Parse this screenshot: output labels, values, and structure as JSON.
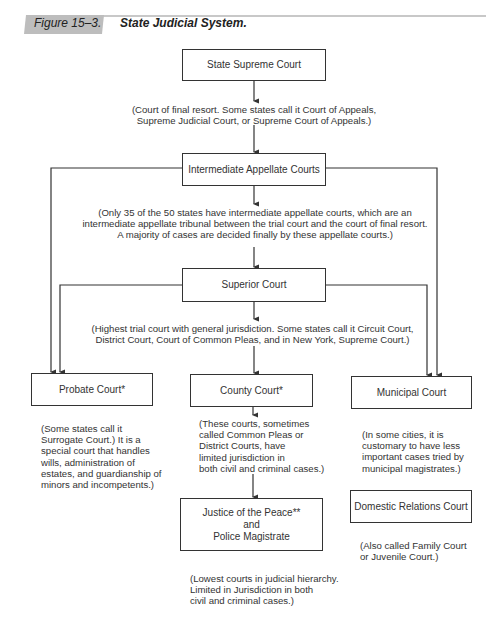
{
  "figure": {
    "label": "Figure 15–3.",
    "title": "State Judicial System."
  },
  "nodes": {
    "state_supreme": {
      "label": "State Supreme Court",
      "note": [
        "(Court of final resort. Some states call it Court of Appeals,",
        "Supreme Judicial Court, or Supreme Court of Appeals.)"
      ]
    },
    "intermediate": {
      "label": "Intermediate Appellate Courts",
      "note": [
        "(Only 35 of the 50 states have intermediate appellate courts, which are an",
        "intermediate appellate tribunal between the trial court and the court of final resort.",
        "A majority of cases are decided finally by these appellate courts.)"
      ]
    },
    "superior": {
      "label": "Superior Court",
      "note": [
        "(Highest trial court with general jurisdiction. Some states call it Circuit Court,",
        "District Court, Court of Common Pleas, and in New York, Supreme Court.)"
      ]
    },
    "probate": {
      "label": "Probate Court*",
      "note": [
        "(Some states call it",
        "Surrogate Court.) It is a",
        "special court that handles",
        "wills, administration of",
        "estates, and guardianship of",
        "minors and incompetents.)"
      ]
    },
    "county": {
      "label": "County Court*",
      "note": [
        "(These courts, sometimes",
        "called Common Pleas or",
        "District Courts, have",
        "limited jurisdiction in",
        "both civil and criminal cases.)"
      ]
    },
    "municipal": {
      "label": "Municipal Court",
      "note": [
        "(In some cities, it is",
        "customary to have less",
        "important cases tried by",
        "municipal magistrates.)"
      ]
    },
    "justice": {
      "label": [
        "Justice of the Peace**",
        "and",
        "Police Magistrate"
      ],
      "note": [
        "(Lowest courts in judicial hierarchy.",
        "Limited in Jurisdiction in both",
        "civil and criminal cases.)"
      ]
    },
    "domestic": {
      "label": "Domestic Relations Court",
      "note": [
        "(Also called Family Court",
        "or Juvenile Court.)"
      ]
    }
  },
  "edges": [
    [
      "State Supreme Court",
      "Intermediate Appellate Courts"
    ],
    [
      "Intermediate Appellate Courts",
      "Superior Court"
    ],
    [
      "Intermediate Appellate Courts",
      "Probate Court*"
    ],
    [
      "Intermediate Appellate Courts",
      "Municipal Court"
    ],
    [
      "Superior Court",
      "Probate Court*"
    ],
    [
      "Superior Court",
      "County Court*"
    ],
    [
      "Superior Court",
      "Municipal Court"
    ],
    [
      "County Court*",
      "Justice of the Peace** and Police Magistrate"
    ]
  ]
}
